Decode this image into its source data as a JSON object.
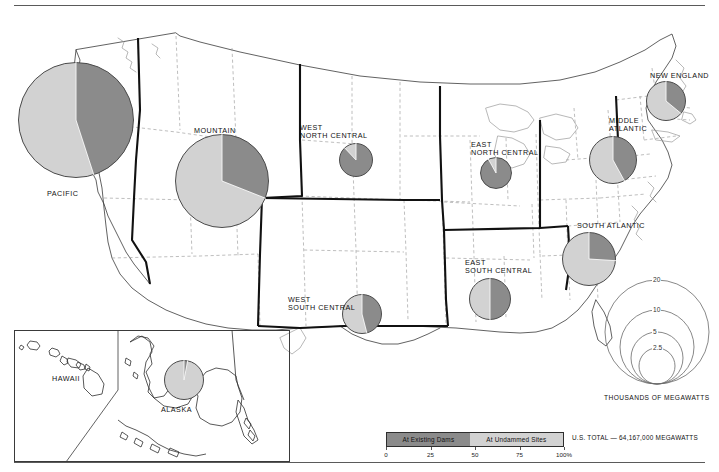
{
  "map": {
    "title_visible": false,
    "regions": [
      {
        "id": "pacific",
        "label": "PACIFIC",
        "label_x": 47,
        "label_y": 190,
        "cx": 76,
        "cy": 120,
        "r": 58,
        "dark_pct": 45,
        "light_pct": 55,
        "rotation": 0,
        "value_k": 22.0
      },
      {
        "id": "mountain",
        "label": "MOUNTAIN",
        "label_x": 194,
        "label_y": 127,
        "cx": 222,
        "cy": 181,
        "r": 47,
        "dark_pct": 31,
        "light_pct": 69,
        "rotation": 0,
        "value_k": 14.5
      },
      {
        "id": "west-north-central",
        "label": "WEST\nNORTH CENTRAL",
        "label_x": 300,
        "label_y": 124,
        "cx": 356,
        "cy": 160,
        "r": 17,
        "dark_pct": 88,
        "light_pct": 12,
        "rotation": 0,
        "value_k": 1.9
      },
      {
        "id": "east-north-central",
        "label": "EAST\nNORTH CENTRAL",
        "label_x": 471,
        "label_y": 141,
        "cx": 496,
        "cy": 173,
        "r": 16,
        "dark_pct": 92,
        "light_pct": 8,
        "rotation": 0,
        "value_k": 1.7
      },
      {
        "id": "middle-atlantic",
        "label": "MIDDLE\nATLANTIC",
        "label_x": 609,
        "label_y": 117,
        "cx": 613,
        "cy": 160,
        "r": 24,
        "dark_pct": 42,
        "light_pct": 58,
        "rotation": 0,
        "value_k": 3.8
      },
      {
        "id": "new-england",
        "label": "NEW ENGLAND",
        "label_x": 650,
        "label_y": 72,
        "cx": 666,
        "cy": 101,
        "r": 20,
        "dark_pct": 36,
        "light_pct": 64,
        "rotation": 0,
        "value_k": 2.6
      },
      {
        "id": "south-atlantic",
        "label": "SOUTH ATLANTIC",
        "label_x": 577,
        "label_y": 222,
        "cx": 589,
        "cy": 259,
        "r": 27,
        "dark_pct": 26,
        "light_pct": 74,
        "rotation": 0,
        "value_k": 4.8
      },
      {
        "id": "east-south-central",
        "label": "EAST\nSOUTH CENTRAL",
        "label_x": 465,
        "label_y": 259,
        "cx": 490,
        "cy": 299,
        "r": 21,
        "dark_pct": 50,
        "light_pct": 50,
        "rotation": 0,
        "value_k": 2.9
      },
      {
        "id": "west-south-central",
        "label": "WEST\nSOUTH CENTRAL",
        "label_x": 288,
        "label_y": 296,
        "cx": 362,
        "cy": 314,
        "r": 20,
        "dark_pct": 46,
        "light_pct": 54,
        "rotation": 0,
        "value_k": 2.6
      },
      {
        "id": "alaska",
        "label": "ALASKA",
        "label_x": 161,
        "label_y": 406,
        "cx": 184,
        "cy": 380,
        "r": 20,
        "dark_pct": 3,
        "light_pct": 97,
        "rotation": 0,
        "value_k": 2.6
      },
      {
        "id": "hawaii",
        "label": "HAWAII",
        "label_x": 52,
        "label_y": 375,
        "cx": null,
        "cy": null,
        "r": 0,
        "dark_pct": 0,
        "light_pct": 0,
        "rotation": 0,
        "value_k": 0
      }
    ]
  },
  "size_legend": {
    "caption": "THOUSANDS OF MEGAWATTS",
    "circles": [
      {
        "label": "20",
        "r": 52
      },
      {
        "label": "10",
        "r": 37
      },
      {
        "label": "5",
        "r": 26
      },
      {
        "label": "2.5",
        "r": 18
      }
    ]
  },
  "value_legend": {
    "segments": [
      {
        "label": "At Existing Dams",
        "pct": 47,
        "color": "#8b8b8b"
      },
      {
        "label": "At Undammed Sites",
        "pct": 53,
        "color": "#d2d2d2"
      }
    ],
    "ticks": [
      {
        "label": "0",
        "pct": 0
      },
      {
        "label": "25",
        "pct": 25
      },
      {
        "label": "50",
        "pct": 50
      },
      {
        "label": "75",
        "pct": 75
      },
      {
        "label": "100%",
        "pct": 100
      }
    ],
    "us_total": "U.S. TOTAL — 64,167,000 MEGAWATTS"
  },
  "colors": {
    "dark_gray": "#8b8b8b",
    "light_gray": "#d2d2d2",
    "outline": "#4a4a4a",
    "state_border": "#9a9a9a",
    "region_border": "#111111"
  }
}
